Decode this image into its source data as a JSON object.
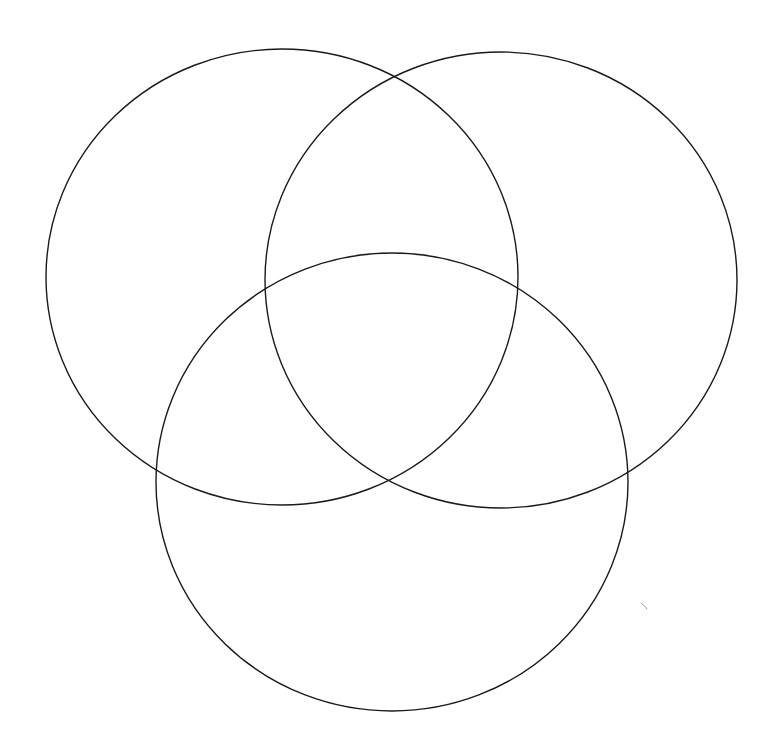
{
  "diagram": {
    "type": "venn",
    "set_count": 3,
    "labels": [],
    "background_color": "#ffffff",
    "stroke_color": "#1a1a1a",
    "mark_color": "#9a9a9a",
    "sets": [
      {
        "id": "left",
        "cx": 282,
        "cy": 277,
        "rx": 236,
        "ry": 228
      },
      {
        "id": "right",
        "cx": 501,
        "cy": 280,
        "rx": 236,
        "ry": 228
      },
      {
        "id": "bottom",
        "cx": 392,
        "cy": 482,
        "rx": 236,
        "ry": 229
      }
    ]
  }
}
